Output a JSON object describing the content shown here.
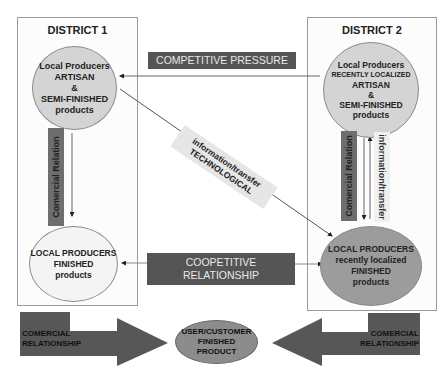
{
  "district1": {
    "title": "DISTRICT 1",
    "top_node": {
      "lines": [
        "Local Producers",
        "ARTISAN",
        "&",
        "SEMI-FINISHED",
        "products"
      ]
    },
    "bottom_node": {
      "lines": [
        "LOCAL PRODUCERS",
        "FINISHED",
        "products"
      ]
    },
    "vertical_label": "Comercial Relation"
  },
  "district2": {
    "title": "DISTRICT 2",
    "top_node": {
      "lines": [
        "Local Producers",
        "RECENTLY LOCALIZED",
        "ARTISAN",
        "&",
        "SEMI-FINISHED",
        "products"
      ]
    },
    "bottom_node": {
      "lines": [
        "LOCAL PRODUCERS",
        "recently localized",
        "FINISHED",
        "products"
      ]
    },
    "vertical_label": "Comercial Relation",
    "vertical_label_2": "information/transfer"
  },
  "middle": {
    "competitive_pressure": "COMPETITIVE PRESSURE",
    "cooperative": [
      "COOPETITIVE",
      "RELATIONSHIP"
    ],
    "diagonal_label": [
      "information/transfer",
      "TECHNOLOGICAL"
    ]
  },
  "bottom": {
    "left_arrow_label": [
      "COMERCIAL",
      "RELATIONSHIP"
    ],
    "right_arrow_label": [
      "COMERCIAL",
      "RELATIONSHIP"
    ],
    "customer_node": [
      "USER/CUSTOMER",
      "FINISHED",
      "PRODUCT"
    ]
  },
  "colors": {
    "dark_label": "#555555",
    "light_circle": "#d4d4d4",
    "dark_circle": "#9c9c9c",
    "box_border": "#9a9a9a"
  }
}
